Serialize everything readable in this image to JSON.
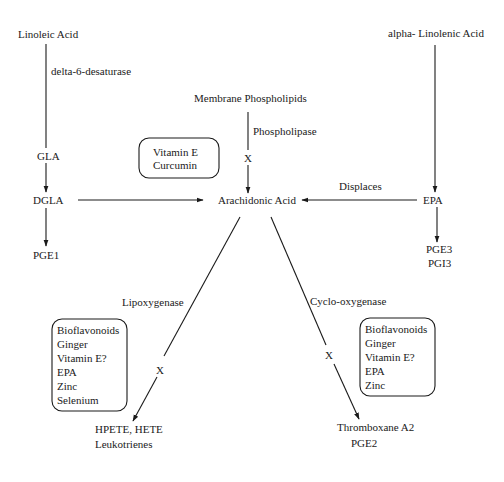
{
  "diagram": {
    "nodes": {
      "linoleic_acid": "Linoleic Acid",
      "alpha_linolenic_acid": "alpha- Linolenic Acid",
      "membrane_phospholipids": "Membrane Phospholipids",
      "gla": "GLA",
      "dgla": "DGLA",
      "pge1": "PGE1",
      "arachidonic_acid": "Arachidonic Acid",
      "epa": "EPA",
      "pge3": "PGE3",
      "pgi3": "PGI3",
      "hpete_hete": "HPETE, HETE",
      "leukotrienes": "Leukotrienes",
      "thromboxane_a2": "Thromboxane A2",
      "pge2": "PGE2"
    },
    "edge_labels": {
      "delta6": "delta-6-desaturase",
      "phospholipase": "Phospholipase",
      "displaces": "Displaces",
      "lipoxygenase": "Lipoxygenase",
      "cyclooxygenase": "Cyclo-oxygenase"
    },
    "inhibit_mark": "X",
    "boxes": {
      "phospholipase_inhibitors": [
        "Vitamin E",
        "Curcumin"
      ],
      "lipoxygenase_inhibitors": [
        "Bioflavonoids",
        "Ginger",
        "Vitamin E?",
        "EPA",
        "Zinc",
        "Selenium"
      ],
      "cyclooxygenase_inhibitors": [
        "Bioflavonoids",
        "Ginger",
        "Vitamin E?",
        "EPA",
        "Zinc"
      ]
    }
  }
}
